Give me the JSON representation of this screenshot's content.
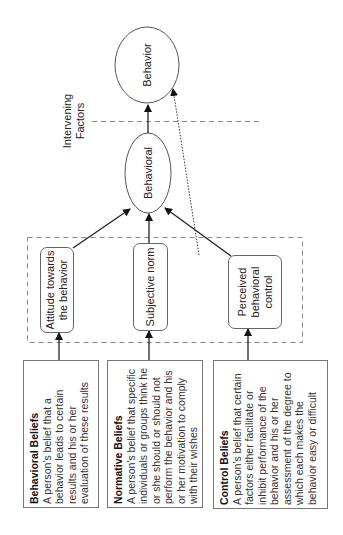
{
  "diagram": {
    "type": "theory-of-planned-behavior",
    "orientation": "rotated-90-ccw",
    "nodes": {
      "behavior": {
        "label": "Behavior",
        "shape": "ellipse"
      },
      "intention": {
        "label": "Behavioral",
        "shape": "ellipse"
      },
      "intervening": {
        "label": "Intervening Factors"
      },
      "attitude": {
        "label": "Attitude towards the behavior",
        "shape": "rounded-rect"
      },
      "subjective_norm": {
        "label": "Subjective norm",
        "shape": "rounded-rect"
      },
      "perceived_control": {
        "label": "Perceived behavioral control",
        "shape": "rounded-rect"
      }
    },
    "beliefs": [
      {
        "title": "Behavioral Beliefs",
        "text": "A person's belief that a behavior leads to certain results and his or her evaluation of these results"
      },
      {
        "title": "Normative Beliefs",
        "text": "A person's belief that specific individuals or groups think he or she should or should not perform the behavior and his or her motivation to comply with their wishes"
      },
      {
        "title": "Control Beliefs",
        "text": "A person's belief that certain factors either facilitate or inhibit performance of the behavior and his or her assessment of the degree to which each makes the behavior easy or difficult"
      }
    ],
    "edges": [
      {
        "from": "Behavioral Beliefs",
        "to": "Attitude towards the behavior",
        "style": "solid"
      },
      {
        "from": "Normative Beliefs",
        "to": "Subjective norm",
        "style": "solid"
      },
      {
        "from": "Control Beliefs",
        "to": "Perceived behavioral control",
        "style": "solid"
      },
      {
        "from": "Attitude towards the behavior",
        "to": "Behavioral",
        "style": "solid"
      },
      {
        "from": "Subjective norm",
        "to": "Behavioral",
        "style": "solid"
      },
      {
        "from": "Perceived behavioral control",
        "to": "Behavioral",
        "style": "solid"
      },
      {
        "from": "Behavioral",
        "to": "Behavior",
        "style": "solid"
      },
      {
        "from": "Perceived behavioral control",
        "to": "Behavior",
        "style": "dotted"
      }
    ],
    "colors": {
      "line": "#333333",
      "dashed": "#888888",
      "box_border": "#777777"
    }
  }
}
